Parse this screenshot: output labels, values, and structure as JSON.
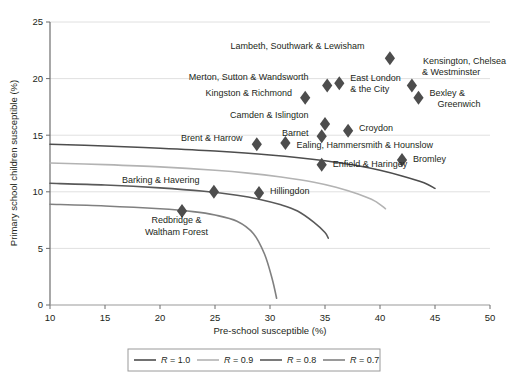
{
  "chart_data": {
    "type": "scatter",
    "title": "",
    "xlabel": "Pre-school susceptible (%)",
    "ylabel": "Primary school children susceptible (%)",
    "xlim": [
      10,
      50
    ],
    "ylim": [
      0,
      25
    ],
    "xticks": [
      "10",
      "15",
      "20",
      "25",
      "30",
      "35",
      "40",
      "45",
      "50"
    ],
    "yticks": [
      "0",
      "5",
      "10",
      "15",
      "20",
      "25"
    ],
    "grid": "horizontal",
    "legend_position": "bottom",
    "marker": "diamond",
    "marker_color": "#4d4d4d",
    "points": [
      {
        "label": "Lambeth, Southwark & Lewisham",
        "x": 40.9,
        "y": 21.8,
        "label_anchor": "end",
        "lx": 38.6,
        "ly": 22.6
      },
      {
        "label": "Kensington, Chelsea & Westminster",
        "x": 42.9,
        "y": 19.4,
        "label_anchor": "start",
        "lx": 43.9,
        "ly": 21.3
      },
      {
        "label": "Merton, Sutton & Wandsworth",
        "x": 35.2,
        "y": 19.4,
        "label_anchor": "end",
        "lx": 33.5,
        "ly": 19.9
      },
      {
        "label": "East London & the City",
        "x": 36.3,
        "y": 19.6,
        "label_anchor": "start",
        "lx": 37.3,
        "ly": 19.8
      },
      {
        "label": "Kingston & Richmond",
        "x": 33.2,
        "y": 18.3,
        "label_anchor": "end",
        "lx": 32.0,
        "ly": 18.5
      },
      {
        "label": "Bexley & Greenwich",
        "x": 43.5,
        "y": 18.3,
        "label_anchor": "start",
        "lx": 44.5,
        "ly": 18.5
      },
      {
        "label": "Camden & Islington",
        "x": 35.0,
        "y": 16.0,
        "label_anchor": "end",
        "lx": 33.5,
        "ly": 16.5
      },
      {
        "label": "Croydon",
        "x": 37.1,
        "y": 15.4,
        "label_anchor": "start",
        "lx": 38.1,
        "ly": 15.4
      },
      {
        "label": "Barnet",
        "x": 34.7,
        "y": 14.9,
        "label_anchor": "end",
        "lx": 33.5,
        "ly": 14.9
      },
      {
        "label": "Brent & Harrow",
        "x": 28.8,
        "y": 14.2,
        "label_anchor": "end",
        "lx": 27.5,
        "ly": 14.5
      },
      {
        "label": "Ealing, Hammersmith & Hounslow",
        "x": 31.4,
        "y": 14.3,
        "label_anchor": "start",
        "lx": 32.4,
        "ly": 13.9
      },
      {
        "label": "Enfield & Haringey",
        "x": 34.7,
        "y": 12.4,
        "label_anchor": "start",
        "lx": 35.7,
        "ly": 12.2
      },
      {
        "label": "Bromley",
        "x": 42.0,
        "y": 12.8,
        "label_anchor": "start",
        "lx": 43.0,
        "ly": 12.6
      },
      {
        "label": "Barking & Havering",
        "x": 24.9,
        "y": 10.0,
        "label_anchor": "end",
        "lx": 23.6,
        "ly": 10.8
      },
      {
        "label": "Hillingdon",
        "x": 29.0,
        "y": 9.9,
        "label_anchor": "start",
        "lx": 30.0,
        "ly": 9.8
      },
      {
        "label": "Redbridge & Waltham Forest",
        "x": 22.0,
        "y": 8.3,
        "label_anchor": "middle",
        "lx": 21.5,
        "ly": 7.2
      }
    ],
    "series": [
      {
        "name": "R = 1.0",
        "color": "#4d4d4d",
        "width": 1.6,
        "values": [
          [
            10,
            14.2
          ],
          [
            15,
            14.05
          ],
          [
            20,
            13.85
          ],
          [
            25,
            13.6
          ],
          [
            30,
            13.25
          ],
          [
            35,
            12.75
          ],
          [
            38,
            12.3
          ],
          [
            40,
            11.9
          ],
          [
            42,
            11.4
          ],
          [
            44,
            10.8
          ],
          [
            45,
            10.3
          ]
        ]
      },
      {
        "name": "R = 0.9",
        "color": "#b3b3b3",
        "width": 1.6,
        "values": [
          [
            10,
            12.55
          ],
          [
            15,
            12.4
          ],
          [
            20,
            12.2
          ],
          [
            25,
            11.9
          ],
          [
            28,
            11.65
          ],
          [
            31,
            11.3
          ],
          [
            34,
            10.85
          ],
          [
            36,
            10.4
          ],
          [
            38,
            9.8
          ],
          [
            39.5,
            9.2
          ],
          [
            40.5,
            8.5
          ]
        ]
      },
      {
        "name": "R = 0.8",
        "color": "#595959",
        "width": 1.6,
        "values": [
          [
            10,
            10.75
          ],
          [
            15,
            10.6
          ],
          [
            20,
            10.35
          ],
          [
            24,
            10.05
          ],
          [
            27,
            9.7
          ],
          [
            29,
            9.35
          ],
          [
            31,
            8.85
          ],
          [
            32.5,
            8.3
          ],
          [
            34,
            7.3
          ],
          [
            35,
            6.4
          ],
          [
            35.3,
            5.9
          ]
        ]
      },
      {
        "name": "R = 0.7",
        "color": "#808080",
        "width": 1.6,
        "values": [
          [
            10,
            8.9
          ],
          [
            15,
            8.75
          ],
          [
            20,
            8.5
          ],
          [
            23,
            8.25
          ],
          [
            25,
            7.95
          ],
          [
            27,
            7.4
          ],
          [
            28.5,
            6.3
          ],
          [
            29.5,
            4.5
          ],
          [
            30.2,
            2.3
          ],
          [
            30.6,
            0.6
          ]
        ]
      }
    ]
  },
  "legend": {
    "items": [
      {
        "label": "R = 1.0",
        "color": "#4d4d4d"
      },
      {
        "label": "R = 0.9",
        "color": "#b3b3b3"
      },
      {
        "label": "R = 0.8",
        "color": "#595959"
      },
      {
        "label": "R = 0.7",
        "color": "#808080"
      }
    ]
  }
}
